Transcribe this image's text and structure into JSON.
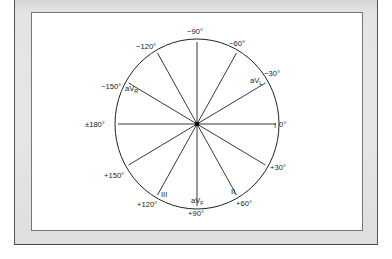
{
  "diagram": {
    "center": {
      "x": 197,
      "y": 124
    },
    "circle": {
      "rx": 82,
      "ry": 85
    },
    "colors": {
      "line": "#222222",
      "frame": "#e4e4e4",
      "panel": "#ffffff"
    },
    "degree_labels": [
      {
        "id": "neg90",
        "text": "−90°",
        "x": 187,
        "y": 34
      },
      {
        "id": "neg60",
        "text": "−60°",
        "x": 229,
        "y": 46
      },
      {
        "id": "neg120",
        "text": "−120°",
        "x": 136,
        "y": 49
      },
      {
        "id": "neg30",
        "text": "−30°",
        "x": 264,
        "y": 76
      },
      {
        "id": "neg150",
        "text": "−150°",
        "x": 101,
        "y": 89
      },
      {
        "id": "pm180",
        "text": "±180°",
        "x": 85,
        "y": 127
      },
      {
        "id": "zero",
        "text": "0°",
        "x": 279,
        "y": 127
      },
      {
        "id": "pos30",
        "text": "+30°",
        "x": 270,
        "y": 170
      },
      {
        "id": "pos150",
        "text": "+150°",
        "x": 104,
        "y": 178
      },
      {
        "id": "pos60",
        "text": "+60°",
        "x": 236,
        "y": 206
      },
      {
        "id": "pos120",
        "text": "+120°",
        "x": 137,
        "y": 207
      },
      {
        "id": "pos90",
        "text": "+90°",
        "x": 188,
        "y": 216
      }
    ],
    "lead_labels": [
      {
        "id": "lead-I",
        "text": "I",
        "sub": "",
        "x": 274,
        "y": 128
      },
      {
        "id": "lead-II",
        "text": "II",
        "sub": "",
        "x": 231,
        "y": 194
      },
      {
        "id": "lead-III",
        "text": "III",
        "sub": "",
        "x": 161,
        "y": 197
      },
      {
        "id": "lead-aVL",
        "text": "aV",
        "sub": "L",
        "x": 250,
        "y": 83
      },
      {
        "id": "lead-aVR",
        "text": "aV",
        "sub": "R",
        "x": 125,
        "y": 91
      },
      {
        "id": "lead-aVF",
        "text": "aV",
        "sub": "F",
        "x": 191,
        "y": 203
      }
    ],
    "axes_deg": [
      0,
      30,
      60,
      90,
      120,
      150,
      180,
      -30,
      -60,
      -90,
      -120,
      -150
    ]
  }
}
